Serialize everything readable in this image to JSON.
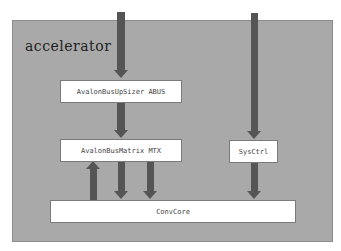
{
  "diagram": {
    "container": {
      "label": "accelerator"
    },
    "blocks": [
      {
        "id": "abus",
        "label": "AvalonBusUpSizer ABUS"
      },
      {
        "id": "mtx",
        "label": "AvalonBusMatrix MTX"
      },
      {
        "id": "sysctrl",
        "label": "SysCtrl"
      },
      {
        "id": "convcore",
        "label": "ConvCore"
      }
    ],
    "connections": [
      {
        "from": "external",
        "to": "abus",
        "direction": "down"
      },
      {
        "from": "abus",
        "to": "mtx",
        "direction": "down"
      },
      {
        "from": "convcore",
        "to": "mtx",
        "direction": "up"
      },
      {
        "from": "mtx",
        "to": "convcore",
        "direction": "down"
      },
      {
        "from": "mtx",
        "to": "convcore",
        "direction": "down"
      },
      {
        "from": "external",
        "to": "sysctrl",
        "direction": "down"
      },
      {
        "from": "sysctrl",
        "to": "convcore",
        "direction": "down"
      }
    ],
    "colors": {
      "container": "#a9a9a9",
      "arrow": "#555555",
      "block": "#ffffff"
    }
  }
}
